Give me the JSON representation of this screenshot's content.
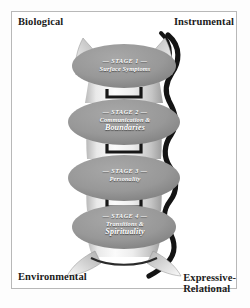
{
  "diagram": {
    "corners": {
      "top_left": "Biological",
      "top_right": "Instrumental",
      "bottom_left": "Environmental",
      "bottom_right": "Expressive-\nRelational"
    },
    "stages": [
      {
        "id": "stage-1",
        "heading": "— STAGE 1 —",
        "lines": [
          "Surface Symptoms"
        ],
        "emphasis_index": -1
      },
      {
        "id": "stage-2",
        "heading": "— STAGE 2 —",
        "lines": [
          "Communication &",
          "Boundaries"
        ],
        "emphasis_index": 1
      },
      {
        "id": "stage-3",
        "heading": "— STAGE 3 —",
        "lines": [
          "Personality"
        ],
        "emphasis_index": -1
      },
      {
        "id": "stage-4",
        "heading": "— STAGE 4 —",
        "lines": [
          "Transitions &",
          "Spirituality"
        ],
        "emphasis_index": 1
      }
    ],
    "colors": {
      "frame_border": "#b8b8b8",
      "page_background": "#ffffff",
      "label_text": "#1b1b1b",
      "disc_fill": "#9a9a9a",
      "disc_fill_dark": "#7d7d7d",
      "column_light": "#f4f4f4",
      "column_mid": "#d2d2d2",
      "shadow_dark": "#1a1a1a",
      "wing_fill": "#c9c9c9",
      "stage_text": "#ffffff"
    }
  }
}
